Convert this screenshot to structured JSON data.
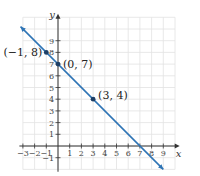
{
  "chart_data": {
    "type": "line",
    "title": "",
    "xlabel": "x",
    "ylabel": "y",
    "xlim": [
      -3,
      10
    ],
    "ylim": [
      -2,
      11
    ],
    "grid": true,
    "x_ticks": [
      "−3",
      "−2",
      "−1",
      "1",
      "2",
      "3",
      "4",
      "5",
      "6",
      "7",
      "8",
      "9"
    ],
    "x_tick_values": [
      -3,
      -2,
      -1,
      1,
      2,
      3,
      4,
      5,
      6,
      7,
      8,
      9
    ],
    "y_ticks": [
      "−1",
      "1",
      "2",
      "3",
      "4",
      "5",
      "6",
      "7",
      "8",
      "9"
    ],
    "y_tick_values": [
      -1,
      1,
      2,
      3,
      4,
      5,
      6,
      7,
      8,
      9
    ],
    "series": [
      {
        "name": "y = -x + 7",
        "color": "#2e74b5",
        "x": [
          -3.2,
          9
        ],
        "y": [
          10.2,
          -2
        ],
        "arrows": "both"
      }
    ],
    "points": [
      {
        "x": -1,
        "y": 8,
        "label": "(−1, 8)"
      },
      {
        "x": 0,
        "y": 7,
        "label": "(0, 7)"
      },
      {
        "x": 3,
        "y": 4,
        "label": "(3, 4)"
      }
    ]
  }
}
